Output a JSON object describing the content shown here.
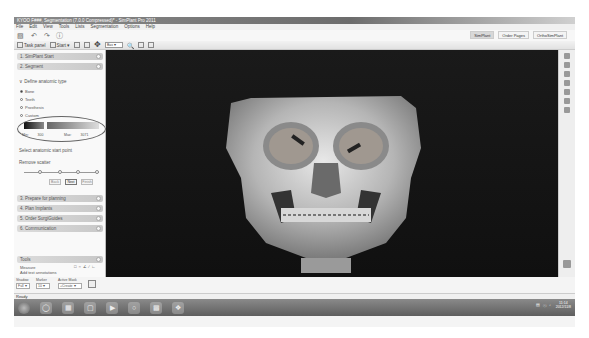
{
  "window": {
    "title": "KYOO F###, Segmentation (7.0.0 Compressed)* - SimPlant Pro 2011"
  },
  "menu": [
    "File",
    "Edit",
    "View",
    "Tools",
    "Lists",
    "Segmentation",
    "Options",
    "Help"
  ],
  "quick_toolbar": {
    "icons": [
      "save-icon",
      "undo-icon",
      "redo-icon",
      "help-icon"
    ]
  },
  "workflow_tabs": [
    {
      "label": "SimPlant",
      "active": true
    },
    {
      "label": "Order Pages",
      "active": false
    },
    {
      "label": "OrthoSimPlant",
      "active": false
    }
  ],
  "toolbar": {
    "task_panel_label": "Task panel",
    "start_label": "Start",
    "view_select_value": "Bas"
  },
  "left_panel": {
    "sections": [
      {
        "label": "1. SimPlant Start"
      },
      {
        "label": "2. Segment"
      }
    ],
    "anatomic_type": {
      "heading": "Define anatomic type",
      "options": [
        {
          "label": "Bone",
          "selected": true
        },
        {
          "label": "Teeth",
          "selected": false
        },
        {
          "label": "Prosthesis",
          "selected": false
        },
        {
          "label": "Custom",
          "selected": false
        }
      ],
      "min_label": "Min:",
      "min_value": "300",
      "max_label": "Max:",
      "max_value": "3071"
    },
    "select_start_point": "Select anatomic start point",
    "remove_scatter": "Remove scatter",
    "nav_buttons": {
      "back": "Back",
      "next": "Next",
      "finish": "Finish"
    },
    "sections_lower": [
      {
        "label": "3. Prepare for planning"
      },
      {
        "label": "4. Plan Implants"
      },
      {
        "label": "5. Order SurgiGuides"
      },
      {
        "label": "6. Communication"
      }
    ],
    "tools": {
      "heading": "Tools",
      "measure_label": "Measure",
      "annotations_label": "Add text annotations"
    },
    "bottom": {
      "shadow_label": "Shadow",
      "shadow_value": "Full",
      "marker_label": "Marker",
      "marker_value": "10",
      "active_mask_label": "Active Mask",
      "active_mask_value": "+Create"
    }
  },
  "viewport": {
    "content": "3D skull rendering"
  },
  "status": {
    "text": "Ready"
  },
  "taskbar": {
    "clock_time": "11:14",
    "clock_date": "2012/11/8"
  }
}
